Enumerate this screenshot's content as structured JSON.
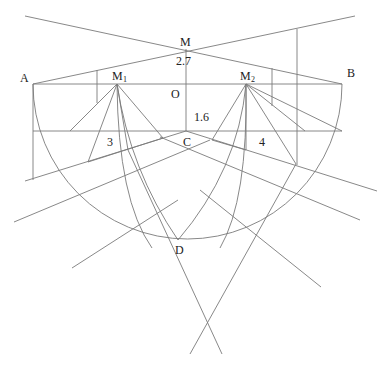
{
  "figure": {
    "stroke_color": "#7a7a7a",
    "text_color": "#222222",
    "labels": {
      "M": "M",
      "A": "A",
      "B": "B",
      "M1": "M",
      "M1_sub": "1",
      "M2": "M",
      "M2_sub": "2",
      "O": "O",
      "C": "C",
      "D": "D",
      "dim_MO": "2.7",
      "dim_OC": "1.6",
      "region_3": "3",
      "region_4": "4"
    },
    "caption": ""
  }
}
